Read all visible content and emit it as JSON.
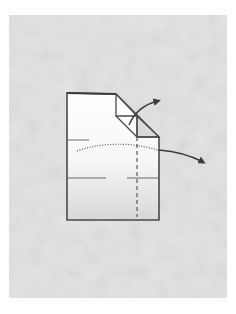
{
  "diagram": {
    "type": "origami-fold-step",
    "colors": {
      "page_background": "#ffffff",
      "panel_background": "#e2e2e2",
      "paper_top": "#ffffff",
      "paper_bottom": "#dcdcdc",
      "stroke": "#4a4a4a",
      "flap_fill": "#d4d4d4"
    },
    "panel": {
      "x": 9,
      "y": 15,
      "width": 218,
      "height": 283
    },
    "paper": {
      "outline": [
        [
          67,
          93
        ],
        [
          116,
          94
        ],
        [
          159,
          137
        ],
        [
          159,
          220
        ],
        [
          67,
          220
        ]
      ],
      "flap_triangle": [
        [
          116,
          94
        ],
        [
          137,
          116
        ],
        [
          116,
          116
        ]
      ],
      "flap_lower": [
        [
          116,
          116
        ],
        [
          137,
          116
        ],
        [
          137,
          137
        ],
        [
          159,
          137
        ]
      ]
    },
    "crease_marks": [
      {
        "kind": "solid-tick",
        "from": [
          67,
          140
        ],
        "to": [
          89,
          140
        ]
      },
      {
        "kind": "solid-tick",
        "from": [
          67,
          178
        ],
        "to": [
          106,
          178
        ]
      },
      {
        "kind": "solid-tick",
        "from": [
          127,
          178
        ],
        "to": [
          159,
          178
        ]
      }
    ],
    "fold_lines": [
      {
        "kind": "valley-dashed-vertical",
        "from": [
          137,
          137
        ],
        "to": [
          137,
          217
        ]
      },
      {
        "kind": "mountain-dotted-curve",
        "path": "M77 151 Q115 138 158 150"
      }
    ],
    "arrows": [
      {
        "name": "corner-fold-arrow",
        "path": "M129 124 Q138 106 158 101",
        "head_at": [
          160,
          101
        ]
      },
      {
        "name": "side-fold-arrow",
        "path": "M160 150 Q185 152 203 162",
        "head_at": [
          205,
          163
        ]
      }
    ]
  }
}
